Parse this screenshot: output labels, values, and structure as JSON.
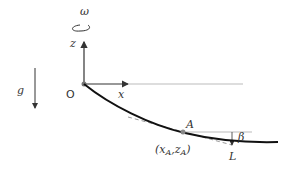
{
  "labels": {
    "omega": "ω",
    "z_axis": "z",
    "x_axis": "x",
    "origin": "O",
    "gravity": "g",
    "point_A": "A",
    "point_A_coords_open": "(x",
    "coord_sub_A": "A",
    "coord_comma": ",z",
    "coord_close": ")",
    "beta": "β",
    "L": "L"
  },
  "colors": {
    "curve": "#111111",
    "axes": "#333333",
    "reference_line": "#bbbbbb",
    "tangent_dashed": "#999999",
    "point": "#888888"
  }
}
